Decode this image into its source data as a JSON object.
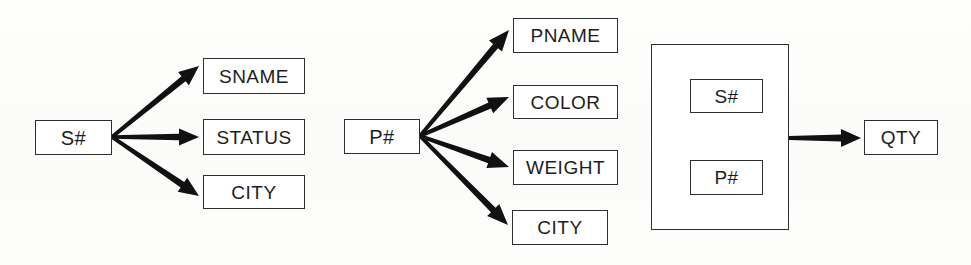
{
  "diagram": {
    "type": "functional-dependency-diagram",
    "background_color": "#fdfdfb",
    "line_color": "#111111",
    "box_border_color": "#2e2e2e",
    "box_fill_color": "#ffffff",
    "groups": [
      {
        "id": "suppliers",
        "determinant": {
          "id": "s-num-determinant",
          "label": "S#",
          "x": 35,
          "y": 120,
          "width": 77,
          "height": 35,
          "font_size": 20
        },
        "dependents": [
          {
            "id": "sname",
            "label": "SNAME",
            "x": 203,
            "y": 58,
            "width": 102,
            "height": 36,
            "font_size": 19
          },
          {
            "id": "status",
            "label": "STATUS",
            "x": 203,
            "y": 119,
            "width": 102,
            "height": 36,
            "font_size": 19
          },
          {
            "id": "city-supplier",
            "label": "CITY",
            "x": 203,
            "y": 175,
            "width": 102,
            "height": 34,
            "font_size": 19
          }
        ],
        "arrows": [
          {
            "id": "arrow-s-sname",
            "from": [
              112,
              137
            ],
            "to": [
              199,
              66
            ],
            "tail_width": 6.5,
            "head_width": 17,
            "head_length": 20
          },
          {
            "id": "arrow-s-status",
            "from": [
              112,
              137
            ],
            "to": [
              199,
              137
            ],
            "tail_width": 6.5,
            "head_width": 17,
            "head_length": 20
          },
          {
            "id": "arrow-s-city",
            "from": [
              112,
              137
            ],
            "to": [
              199,
              196
            ],
            "tail_width": 6.5,
            "head_width": 17,
            "head_length": 20
          }
        ]
      },
      {
        "id": "parts",
        "determinant": {
          "id": "p-num-determinant",
          "label": "P#",
          "x": 344,
          "y": 119,
          "width": 76,
          "height": 35,
          "font_size": 20
        },
        "dependents": [
          {
            "id": "pname",
            "label": "PNAME",
            "x": 513,
            "y": 18,
            "width": 105,
            "height": 35,
            "font_size": 19
          },
          {
            "id": "color",
            "label": "COLOR",
            "x": 513,
            "y": 85,
            "width": 105,
            "height": 34,
            "font_size": 19
          },
          {
            "id": "weight",
            "label": "WEIGHT",
            "x": 513,
            "y": 150,
            "width": 105,
            "height": 35,
            "font_size": 19
          },
          {
            "id": "city-part",
            "label": "CITY",
            "x": 512,
            "y": 210,
            "width": 96,
            "height": 35,
            "font_size": 19
          }
        ],
        "arrows": [
          {
            "id": "arrow-p-pname",
            "from": [
              420,
              136
            ],
            "to": [
              509,
              30
            ],
            "tail_width": 6.5,
            "head_width": 17,
            "head_length": 21
          },
          {
            "id": "arrow-p-color",
            "from": [
              420,
              136
            ],
            "to": [
              509,
              97
            ],
            "tail_width": 6.5,
            "head_width": 17,
            "head_length": 21
          },
          {
            "id": "arrow-p-weight",
            "from": [
              420,
              136
            ],
            "to": [
              509,
              167
            ],
            "tail_width": 6.5,
            "head_width": 17,
            "head_length": 21
          },
          {
            "id": "arrow-p-city",
            "from": [
              420,
              136
            ],
            "to": [
              508,
              225
            ],
            "tail_width": 6.5,
            "head_width": 17,
            "head_length": 21
          }
        ]
      },
      {
        "id": "shipments",
        "composite_key": {
          "id": "composite-key-box",
          "x": 651,
          "y": 44,
          "width": 138,
          "height": 186,
          "members": [
            {
              "id": "s-num-member",
              "label": "S#",
              "x": 690,
              "y": 79,
              "width": 73,
              "height": 34,
              "font_size": 19
            },
            {
              "id": "p-num-member",
              "label": "P#",
              "x": 690,
              "y": 160,
              "width": 73,
              "height": 35,
              "font_size": 19
            }
          ]
        },
        "dependents": [
          {
            "id": "qty",
            "label": "QTY",
            "x": 864,
            "y": 120,
            "width": 74,
            "height": 35,
            "font_size": 19
          }
        ],
        "arrows": [
          {
            "id": "arrow-key-qty",
            "from": [
              789,
              138
            ],
            "to": [
              861,
              138
            ],
            "tail_width": 7,
            "head_width": 18,
            "head_length": 20
          }
        ]
      }
    ]
  }
}
